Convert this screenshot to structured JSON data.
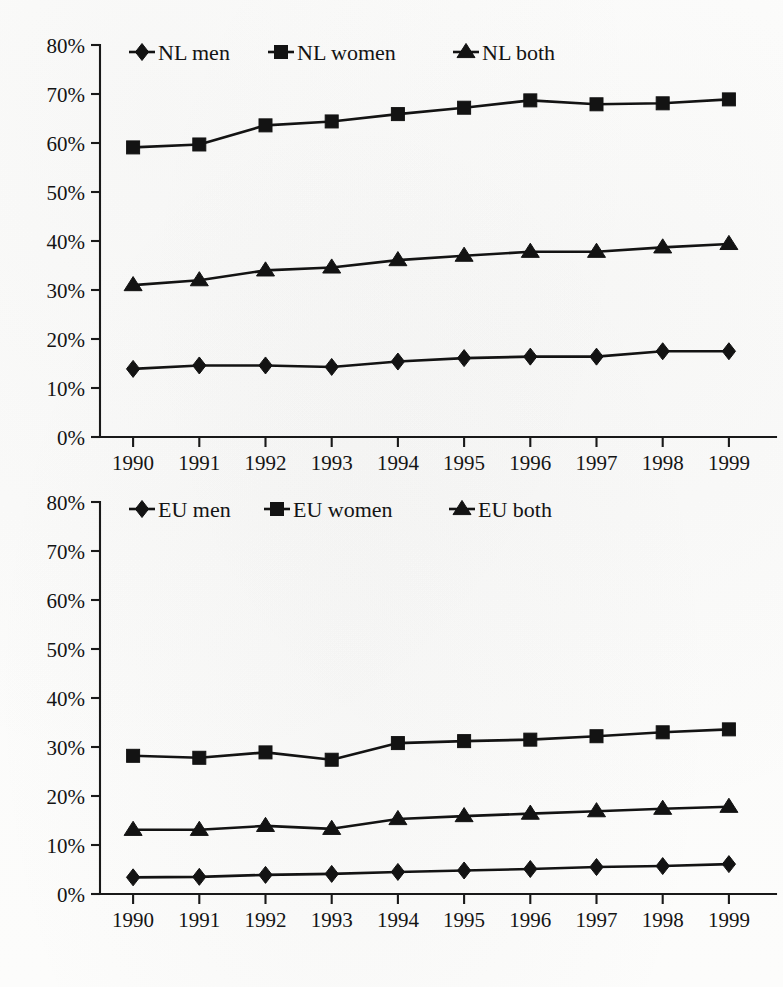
{
  "chart_data": [
    {
      "type": "line",
      "title": "",
      "xlabel": "",
      "ylabel": "",
      "panel": "top",
      "region": "NL",
      "x": [
        "1990",
        "1991",
        "1992",
        "1993",
        "1994",
        "1995",
        "1996",
        "1997",
        "1998",
        "1999"
      ],
      "categories": [
        "1990",
        "1991",
        "1992",
        "1993",
        "1994",
        "1995",
        "1996",
        "1997",
        "1998",
        "1999"
      ],
      "ylim": [
        0,
        80
      ],
      "yticks": [
        "0%",
        "10%",
        "20%",
        "30%",
        "40%",
        "50%",
        "60%",
        "70%",
        "80%"
      ],
      "ytick_values": [
        0,
        10,
        20,
        30,
        40,
        50,
        60,
        70,
        80
      ],
      "grid": false,
      "legend_position": "top-left-inside",
      "series": [
        {
          "name": "NL men",
          "marker": "diamond",
          "values": [
            13.9,
            14.6,
            14.6,
            14.3,
            15.4,
            16.1,
            16.4,
            16.4,
            17.5,
            17.5
          ]
        },
        {
          "name": "NL women",
          "marker": "square",
          "values": [
            59.1,
            59.7,
            63.6,
            64.4,
            65.9,
            67.2,
            68.7,
            67.9,
            68.1,
            68.9
          ]
        },
        {
          "name": "NL both",
          "marker": "triangle",
          "values": [
            31.0,
            32.0,
            34.0,
            34.6,
            36.1,
            37.0,
            37.8,
            37.8,
            38.7,
            39.4
          ]
        }
      ]
    },
    {
      "type": "line",
      "title": "",
      "xlabel": "",
      "ylabel": "",
      "panel": "bottom",
      "region": "EU",
      "x": [
        "1990",
        "1991",
        "1992",
        "1993",
        "1994",
        "1995",
        "1996",
        "1997",
        "1998",
        "1999"
      ],
      "categories": [
        "1990",
        "1991",
        "1992",
        "1993",
        "1994",
        "1995",
        "1996",
        "1997",
        "1998",
        "1999"
      ],
      "ylim": [
        0,
        80
      ],
      "yticks": [
        "0%",
        "10%",
        "20%",
        "30%",
        "40%",
        "50%",
        "60%",
        "70%",
        "80%"
      ],
      "ytick_values": [
        0,
        10,
        20,
        30,
        40,
        50,
        60,
        70,
        80
      ],
      "grid": false,
      "legend_position": "top-left-inside",
      "series": [
        {
          "name": "EU men",
          "marker": "diamond",
          "values": [
            3.4,
            3.5,
            3.9,
            4.1,
            4.5,
            4.8,
            5.1,
            5.5,
            5.7,
            6.1
          ]
        },
        {
          "name": "EU women",
          "marker": "square",
          "values": [
            28.2,
            27.8,
            28.9,
            27.4,
            30.8,
            31.2,
            31.5,
            32.2,
            33.0,
            33.6
          ]
        },
        {
          "name": "EU both",
          "marker": "triangle",
          "values": [
            13.1,
            13.1,
            13.9,
            13.3,
            15.3,
            15.9,
            16.4,
            16.9,
            17.4,
            17.8
          ]
        }
      ]
    }
  ],
  "colors": {
    "ink": "#131313",
    "axis": "#191919",
    "paper": "#fcfcfb"
  }
}
